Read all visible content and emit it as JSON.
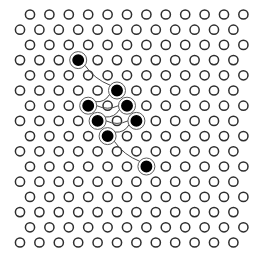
{
  "diagram": {
    "title": "",
    "background": "#ffffff",
    "lattice": {
      "rows": 16,
      "cols": 12,
      "origin_y": 14.5,
      "row_spacing": 15.2,
      "col_spacing": 19.4,
      "even_row_x0": 30,
      "odd_row_x0": 20,
      "radius": 4.6,
      "stroke_color": "#2e2e2e"
    },
    "filled_sites": [
      {
        "row": 3,
        "col": 3
      },
      {
        "row": 5,
        "col": 5
      },
      {
        "row": 6,
        "col": 3
      },
      {
        "row": 6,
        "col": 5
      },
      {
        "row": 7,
        "col": 4
      },
      {
        "row": 7,
        "col": 6
      },
      {
        "row": 8,
        "col": 4
      },
      {
        "row": 10,
        "col": 6
      }
    ],
    "path_order": [
      0,
      1,
      2,
      3,
      4,
      5,
      6,
      7
    ],
    "filled_color": "#000000",
    "path_color": "#4a4a4a"
  }
}
